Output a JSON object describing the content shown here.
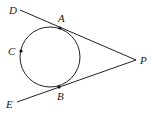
{
  "diagram": {
    "type": "geometry",
    "circle": {
      "cx": 50,
      "cy": 57,
      "r": 30
    },
    "points": {
      "A": {
        "label": "A",
        "x": 60,
        "y": 28,
        "lx": 58,
        "ly": 22
      },
      "B": {
        "label": "B",
        "x": 59,
        "y": 87,
        "lx": 57,
        "ly": 100
      },
      "C": {
        "label": "C",
        "x": 21,
        "y": 51,
        "lx": 8,
        "ly": 55
      },
      "P": {
        "label": "P",
        "x": 136,
        "y": 60,
        "lx": 140,
        "ly": 64
      },
      "D": {
        "label": "D",
        "x": 20,
        "y": 10,
        "lx": 9,
        "ly": 14
      },
      "E": {
        "label": "E",
        "x": 17,
        "y": 102,
        "lx": 6,
        "ly": 108
      }
    },
    "segments": [
      {
        "from": "D",
        "to": "P",
        "name": "tangent-DP"
      },
      {
        "from": "E",
        "to": "P",
        "name": "tangent-EP"
      }
    ],
    "colors": {
      "stroke": "#222222",
      "point": "#111111",
      "text": "#1a1a1a"
    }
  }
}
